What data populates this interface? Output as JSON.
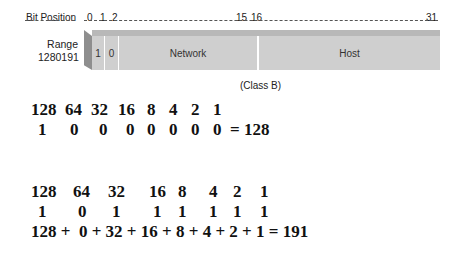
{
  "diagram": {
    "bit_position_label": "Bit Position",
    "bit_ticks": [
      "0",
      "1",
      "2",
      "15",
      "16",
      "31"
    ],
    "range_label": "Range",
    "range_value": "1280191",
    "cells": [
      "1",
      "0",
      "Network",
      "Host"
    ],
    "caption": "(Class B)"
  },
  "example1": {
    "weights": [
      "128",
      "64",
      "32",
      "16",
      "8",
      "4",
      "2",
      "1"
    ],
    "bits": [
      "1",
      "0",
      "0",
      "0",
      "0",
      "0",
      "0",
      "0"
    ],
    "result": "= 128"
  },
  "example2": {
    "weights": [
      "128",
      "64",
      "32",
      "16",
      "8",
      "4",
      "2",
      "1"
    ],
    "bits": [
      "1",
      "0",
      "1",
      "1",
      "1",
      "1",
      "1",
      "1"
    ],
    "sum": "128 +  0 + 32 + 16 + 8 + 4 + 2 + 1 = 191"
  }
}
